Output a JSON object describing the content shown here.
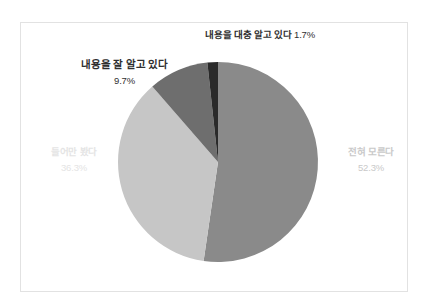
{
  "chart_data": {
    "type": "pie",
    "title": "",
    "legend_position": "none",
    "grid": false,
    "center": {
      "x": 218,
      "y": 162
    },
    "radius": 100,
    "start_angle_deg": 0,
    "direction": "clockwise",
    "categories": [
      "전혀 모른다",
      "들어만 봤다",
      "내용을 잘 알고 있다",
      "내용을 대충 알고 있다"
    ],
    "values": [
      52.3,
      36.3,
      9.7,
      1.7
    ],
    "colors": [
      "#8a8a8a",
      "#c6c6c6",
      "#6e6e6e",
      "#2a2a2a"
    ],
    "slices": [
      {
        "label": "전혀 모른다",
        "percent_text": "52.3%",
        "value": 52.3,
        "color": "#8a8a8a",
        "label_color": "#c9c9c9"
      },
      {
        "label": "들어만 봤다",
        "percent_text": "36.3%",
        "value": 36.3,
        "color": "#c6c6c6",
        "label_color": "#e4e4e4"
      },
      {
        "label": "내용을 잘 알고 있다",
        "percent_text": "9.7%",
        "value": 9.7,
        "color": "#6e6e6e",
        "label_color": "#2f2f2f"
      },
      {
        "label": "내용을 대충 알고 있다",
        "percent_text": " 1.7%",
        "value": 1.7,
        "color": "#2a2a2a",
        "label_color": "#2f2f2f"
      }
    ]
  },
  "frame": {
    "border_color": "#e2e2e2",
    "background": "#ffffff"
  }
}
